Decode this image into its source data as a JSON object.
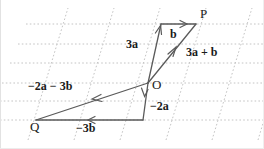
{
  "figure": {
    "background_color": "#ffffff",
    "grid_color": "#c9c9c9",
    "vector_color": "#555555",
    "label_color": "#1a1a1a",
    "width": 264,
    "height": 149
  },
  "points": {
    "P": {
      "label": "P",
      "x": 200,
      "y": 13
    },
    "O": {
      "label": "O",
      "x": 152,
      "y": 84
    },
    "Q": {
      "label": "Q",
      "x": 30,
      "y": 126
    }
  },
  "vectors": [
    {
      "name": "b",
      "label": "b",
      "label_x": 170,
      "label_y": 34,
      "from": {
        "x": 161,
        "y": 24
      },
      "to": {
        "x": 196,
        "y": 24
      },
      "arrow_at": "end",
      "direction": "right"
    },
    {
      "name": "3a",
      "label": "3a",
      "label_x": 126,
      "label_y": 43,
      "from": {
        "x": 148,
        "y": 83
      },
      "to": {
        "x": 161,
        "y": 24
      },
      "arrow_at": "end",
      "direction": "up"
    },
    {
      "name": "3a + b",
      "label": "3a + b",
      "label_x": 186,
      "label_y": 51,
      "from": {
        "x": 148,
        "y": 83
      },
      "to": {
        "x": 196,
        "y": 24
      },
      "arrow_at": "end",
      "direction": "up-right"
    },
    {
      "name": "-2a",
      "label": "−2a",
      "label_x": 150,
      "label_y": 105,
      "from": {
        "x": 148,
        "y": 83
      },
      "to": {
        "x": 143,
        "y": 120
      },
      "arrow_at": "end",
      "direction": "down"
    },
    {
      "name": "-3b",
      "label": "−3b",
      "label_x": 76,
      "label_y": 127,
      "from": {
        "x": 143,
        "y": 120
      },
      "to": {
        "x": 36,
        "y": 120
      },
      "arrow_at": "middle",
      "direction": "left"
    },
    {
      "name": "-2a - 3b",
      "label": "−2a − 3b",
      "label_x": 28,
      "label_y": 85,
      "from": {
        "x": 148,
        "y": 83
      },
      "to": {
        "x": 36,
        "y": 120
      },
      "arrow_at": "middle",
      "direction": "down-left"
    }
  ],
  "grid": {
    "type": "oblique-lattice",
    "horizontal_lines_y": [
      24,
      44,
      63,
      83,
      101,
      120
    ],
    "slanted_lines_x_at_bottom": [
      28,
      74,
      120,
      166,
      212,
      258
    ],
    "slant_dx_per_height": 0.3,
    "style": "dotted"
  }
}
